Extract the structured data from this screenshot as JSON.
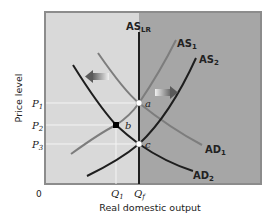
{
  "diagram": {
    "type": "AS-AD model",
    "colors": {
      "left_bg": "#d9d9d9",
      "right_bg": "#a6a6a6",
      "frame": "#8c8c8c",
      "dark_curve": "#1e1e1e",
      "light_curve": "#7d7d7d",
      "grid_line": "#f2f2f2"
    },
    "axes": {
      "y_label": "Price level",
      "x_label": "Real domestic output",
      "origin": "0"
    },
    "y_ticks": [
      {
        "label": "P",
        "sub": "1"
      },
      {
        "label": "P",
        "sub": "2"
      },
      {
        "label": "P",
        "sub": "3"
      }
    ],
    "x_ticks": [
      {
        "label": "Q",
        "sub": "1"
      },
      {
        "label": "Q",
        "sub": "f"
      }
    ],
    "curves": {
      "as_lr": {
        "label": "AS",
        "sub": "LR"
      },
      "as1": {
        "label": "AS",
        "sub": "1"
      },
      "as2": {
        "label": "AS",
        "sub": "2"
      },
      "ad1": {
        "label": "AD",
        "sub": "1"
      },
      "ad2": {
        "label": "AD",
        "sub": "2"
      }
    },
    "points": {
      "a": "a",
      "b": "b",
      "c": "c"
    },
    "arrows": {
      "left": "shift-left-arrow",
      "right": "shift-right-arrow"
    }
  }
}
